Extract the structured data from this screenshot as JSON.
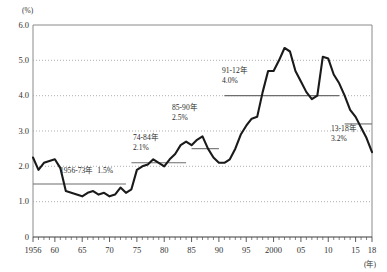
{
  "chart_data": {
    "type": "line",
    "title": "",
    "subtitle": "",
    "xlabel": "(年)",
    "ylabel": "(%)",
    "ylim": [
      0,
      6.0
    ],
    "xlim": [
      1956,
      2018
    ],
    "grid": true,
    "legend": "none",
    "y_ticks": [
      "0",
      "1.0",
      "2.0",
      "3.0",
      "4.0",
      "5.0",
      "6.0"
    ],
    "y_tick_values": [
      0,
      1.0,
      2.0,
      3.0,
      4.0,
      5.0,
      6.0
    ],
    "x_ticks": [
      "1956",
      "60",
      "65",
      "70",
      "75",
      "80",
      "85",
      "90",
      "95",
      "2000",
      "05",
      "10",
      "15",
      "18"
    ],
    "x_tick_values": [
      1956,
      1960,
      1965,
      1970,
      1975,
      1980,
      1985,
      1990,
      1995,
      2000,
      2005,
      2010,
      2015,
      2018
    ],
    "x": [
      1956,
      1957,
      1958,
      1959,
      1960,
      1961,
      1962,
      1963,
      1964,
      1965,
      1966,
      1967,
      1968,
      1969,
      1970,
      1971,
      1972,
      1973,
      1974,
      1975,
      1976,
      1977,
      1978,
      1979,
      1980,
      1981,
      1982,
      1983,
      1984,
      1985,
      1986,
      1987,
      1988,
      1989,
      1990,
      1991,
      1992,
      1993,
      1994,
      1995,
      1996,
      1997,
      1998,
      1999,
      2000,
      2001,
      2002,
      2003,
      2004,
      2005,
      2006,
      2007,
      2008,
      2009,
      2010,
      2011,
      2012,
      2013,
      2014,
      2015,
      2016,
      2017,
      2018
    ],
    "values": [
      2.25,
      1.9,
      2.1,
      2.15,
      2.2,
      1.95,
      1.3,
      1.25,
      1.2,
      1.15,
      1.25,
      1.3,
      1.2,
      1.25,
      1.15,
      1.2,
      1.4,
      1.25,
      1.35,
      1.9,
      2.0,
      2.05,
      2.2,
      2.1,
      2.0,
      2.2,
      2.35,
      2.6,
      2.7,
      2.6,
      2.75,
      2.85,
      2.5,
      2.25,
      2.1,
      2.1,
      2.2,
      2.5,
      2.9,
      3.15,
      3.35,
      3.4,
      4.1,
      4.7,
      4.7,
      5.0,
      5.35,
      5.25,
      4.7,
      4.4,
      4.1,
      3.9,
      4.0,
      5.1,
      5.05,
      4.6,
      4.35,
      4.0,
      3.6,
      3.4,
      3.1,
      2.8,
      2.4
    ],
    "average_lines": [
      {
        "label_line1": "1956-73年",
        "label_line2": "1.5%",
        "value": 1.5,
        "x_start": 1956,
        "x_end": 1973,
        "inline": true
      },
      {
        "label_line1": "74-84年",
        "label_line2": "2.1%",
        "value": 2.1,
        "x_start": 1974,
        "x_end": 1984,
        "inline": false
      },
      {
        "label_line1": "85-90年",
        "label_line2": "2.5%",
        "value": 2.5,
        "x_start": 1985,
        "x_end": 1990,
        "inline": false
      },
      {
        "label_line1": "91-12年",
        "label_line2": "4.0%",
        "value": 4.0,
        "x_start": 1991,
        "x_end": 2012,
        "inline": false
      },
      {
        "label_line1": "13-18年",
        "label_line2": "3.2%",
        "value": 3.2,
        "x_start": 2013,
        "x_end": 2018,
        "inline": false
      }
    ],
    "annotation_positions": [
      {
        "left": 60,
        "top": 166
      },
      {
        "left": 133,
        "top": 133
      },
      {
        "left": 172,
        "top": 103
      },
      {
        "left": 222,
        "top": 66
      },
      {
        "left": 331,
        "top": 124
      }
    ]
  }
}
